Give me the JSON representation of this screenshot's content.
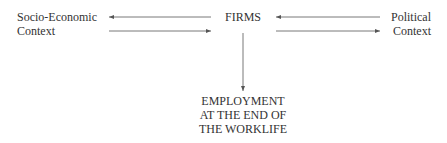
{
  "diagram": {
    "nodes": {
      "socio": {
        "line1": "Socio-Economic",
        "line2": "Context"
      },
      "firms": {
        "label": "FIRMS"
      },
      "political": {
        "line1": "Political",
        "line2": "Context"
      },
      "employment": {
        "line1": "EMPLOYMENT",
        "line2": "AT THE END OF",
        "line3": "THE WORKLIFE"
      }
    },
    "edges": [
      {
        "from": "firms",
        "to": "socio"
      },
      {
        "from": "socio",
        "to": "firms"
      },
      {
        "from": "political",
        "to": "firms"
      },
      {
        "from": "firms",
        "to": "political"
      },
      {
        "from": "firms",
        "to": "employment"
      }
    ],
    "colors": {
      "line": "#555555",
      "text": "#333333"
    }
  }
}
